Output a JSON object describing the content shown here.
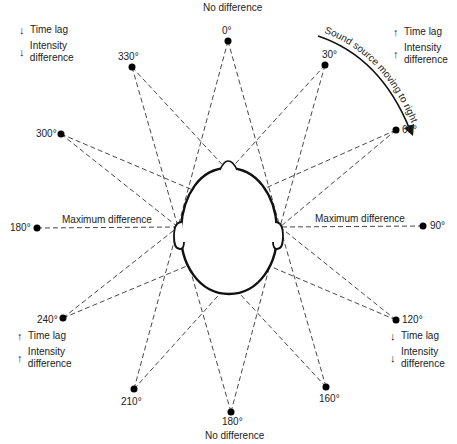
{
  "diagram": {
    "arc_label": "Sound source moving to right",
    "top_label": "No difference",
    "bottom_label": "No difference",
    "left_label": "Maximum difference",
    "right_label": "Maximum difference",
    "sources": [
      {
        "angle": "0°",
        "x": 228,
        "y": 41
      },
      {
        "angle": "30°",
        "x": 325,
        "y": 65
      },
      {
        "angle": "60°",
        "x": 396,
        "y": 130
      },
      {
        "angle": "90°",
        "x": 423,
        "y": 226
      },
      {
        "angle": "120°",
        "x": 396,
        "y": 320
      },
      {
        "angle": "160°",
        "x": 326,
        "y": 387
      },
      {
        "angle": "180°",
        "x": 231,
        "y": 412
      },
      {
        "angle": "210°",
        "x": 134,
        "y": 389
      },
      {
        "angle": "240°",
        "x": 63,
        "y": 318
      },
      {
        "angle": "180°",
        "x": 37,
        "y": 228
      },
      {
        "angle": "300°",
        "x": 61,
        "y": 134
      },
      {
        "angle": "330°",
        "x": 132,
        "y": 67
      }
    ],
    "legends": {
      "top_left": {
        "time": "Time lag",
        "time_dir": "down",
        "intensity": "Intensity difference",
        "intensity_dir": "down"
      },
      "top_right": {
        "time": "Time lag",
        "time_dir": "up",
        "intensity": "Intensity difference",
        "intensity_dir": "up"
      },
      "bottom_left": {
        "time": "Time lag",
        "time_dir": "up",
        "intensity": "Intensity difference",
        "intensity_dir": "up"
      },
      "bottom_right": {
        "time": "Time lag",
        "time_dir": "down",
        "intensity": "Intensity difference",
        "intensity_dir": "down"
      }
    },
    "arrows": {
      "up": "↑",
      "down": "↓"
    }
  }
}
